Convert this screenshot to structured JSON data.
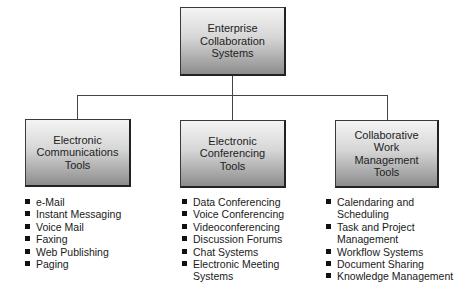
{
  "diagram": {
    "type": "hierarchy",
    "root": {
      "label": "Enterprise\nCollaboration\nSystems"
    },
    "children": [
      {
        "label": "Electronic\nCommunications\nTools",
        "items": [
          "e-Mail",
          "Instant Messaging",
          "Voice Mail",
          "Faxing",
          "Web Publishing",
          "Paging"
        ]
      },
      {
        "label": "Electronic\nConferencing\nTools",
        "items": [
          "Data Conferencing",
          "Voice Conferencing",
          "Videoconferencing",
          "Discussion Forums",
          "Chat Systems",
          "Electronic Meeting Systems"
        ]
      },
      {
        "label": "Collaborative\nWork\nManagement\nTools",
        "items": [
          "Calendaring and Scheduling",
          "Task and Project Management",
          "Workflow Systems",
          "Document Sharing",
          "Knowledge Management"
        ]
      }
    ]
  },
  "colors": {
    "box_top": "#f4f4f4",
    "box_bottom": "#8c8c8c",
    "line": "#444444",
    "bullet": "#111111"
  }
}
